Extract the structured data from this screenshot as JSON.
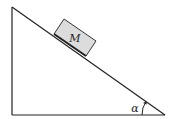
{
  "diagram": {
    "type": "inclined-plane",
    "block_label": "M",
    "angle_label": "α",
    "colors": {
      "line": "#222222",
      "block_fill": "#dcdcdc",
      "background": "#ffffff"
    }
  }
}
